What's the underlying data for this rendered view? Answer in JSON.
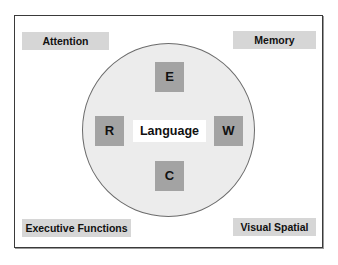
{
  "diagram": {
    "corners": {
      "top_left": "Attention",
      "top_right": "Memory",
      "bottom_left": "Executive Functions",
      "bottom_right": "Visual Spatial"
    },
    "center": {
      "label": "Language",
      "skills": {
        "top": "E",
        "left": "R",
        "right": "W",
        "bottom": "C"
      }
    },
    "colors": {
      "corner_fill": "#d6d6d6",
      "circle_fill": "#ececec",
      "skill_fill": "#a3a3a3",
      "frame_border": "#3a3a3a",
      "text": "#111111"
    }
  }
}
